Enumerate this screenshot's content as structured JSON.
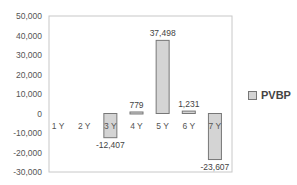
{
  "chart_data": {
    "type": "bar",
    "title": "",
    "xlabel": "",
    "ylabel": "",
    "categories": [
      "1 Y",
      "2 Y",
      "3 Y",
      "4 Y",
      "5 Y",
      "6 Y",
      "7 Y"
    ],
    "series": [
      {
        "name": "PVBP",
        "values": [
          0,
          0,
          -12407,
          779,
          37498,
          1231,
          -23607
        ]
      }
    ],
    "data_labels": [
      "",
      "",
      "-12,407",
      "779",
      "37,498",
      "1,231",
      "-23,607"
    ],
    "ylim": [
      -30000,
      50000
    ],
    "yticks": [
      50000,
      40000,
      30000,
      20000,
      10000,
      0,
      -10000,
      -20000,
      -30000
    ],
    "ytick_labels": [
      "50,000",
      "40,000",
      "30,000",
      "20,000",
      "10,000",
      "0",
      "-10,000",
      "-20,000",
      "-30,000"
    ],
    "grid": false,
    "legend_position": "right",
    "colors": {
      "bar_fill": "#d4d4d4",
      "bar_stroke": "#777777",
      "axis": "#b0b0b0"
    }
  },
  "legend": {
    "label": "PVBP"
  }
}
